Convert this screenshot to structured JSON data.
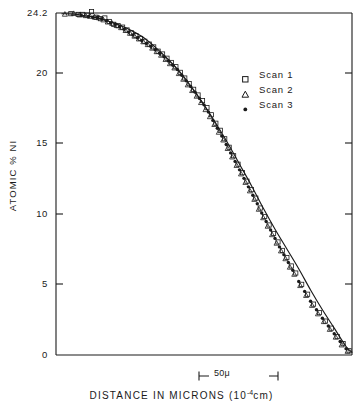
{
  "figure": {
    "background_color": "#ffffff",
    "ink_color": "#1a1a1a"
  },
  "axes": {
    "y_title": "ATOMIC % NI",
    "x_title_main": "DISTANCE IN MICRONS (10",
    "x_title_sup": "-4",
    "x_title_tail": "cm)",
    "y_ticks": [
      "24.2",
      "20",
      "15",
      "10",
      "5",
      "0"
    ],
    "scale_bar_label": "50μ"
  },
  "legend": {
    "entries": [
      {
        "label": "Scan 1",
        "marker": "open-square"
      },
      {
        "label": "Scan 2",
        "marker": "open-triangle"
      },
      {
        "label": "Scan 3",
        "marker": "filled-circle"
      }
    ]
  },
  "chart_data": {
    "type": "scatter",
    "title": "",
    "xlabel": "DISTANCE IN MICRONS (10^-4 cm)",
    "ylabel": "ATOMIC % NI",
    "xlim": [
      0,
      100
    ],
    "ylim": [
      0,
      24.2
    ],
    "grid": false,
    "legend_position": "upper-right",
    "y_tick_values": [
      0,
      5,
      10,
      15,
      20,
      24.2
    ],
    "x_tick_values": [],
    "annotations": [
      {
        "text": "50μ",
        "type": "scale-bar",
        "x_start": 48.5,
        "x_end": 75.2
      }
    ],
    "series": [
      {
        "name": "Scan 1",
        "marker": "open-square",
        "x": [
          5.0,
          7.5,
          9.0,
          10.5,
          12.0,
          13.5,
          15.0,
          16.5,
          18.0,
          19.5,
          21.0,
          22.5,
          24.0,
          25.5,
          27.0,
          28.5,
          30.0,
          31.5,
          33.0,
          34.5,
          36.0,
          37.5,
          39.0,
          40.5,
          42.0,
          43.5,
          45.0,
          46.5,
          48.0,
          49.5,
          51.0,
          52.5,
          54.0,
          55.5,
          57.0,
          58.5,
          60.0,
          61.5,
          63.0,
          64.5,
          66.0,
          67.5,
          69.0,
          70.5,
          72.0,
          73.5,
          75.0,
          76.5,
          78.0,
          79.5,
          81.0,
          83.0,
          85.0,
          87.0,
          89.0,
          91.0,
          93.0,
          95.0,
          97.0,
          99.0
        ],
        "y": [
          24.15,
          24.1,
          24.1,
          24.05,
          24.3,
          23.9,
          23.8,
          23.85,
          23.6,
          23.4,
          23.3,
          23.2,
          23.0,
          22.8,
          22.6,
          22.4,
          22.2,
          22.0,
          21.8,
          21.5,
          21.3,
          21.0,
          20.7,
          20.4,
          20.0,
          19.6,
          19.2,
          18.8,
          18.4,
          18.0,
          17.5,
          17.0,
          16.4,
          15.9,
          15.3,
          14.7,
          14.1,
          13.5,
          12.9,
          12.3,
          11.7,
          11.1,
          10.4,
          9.8,
          9.2,
          8.6,
          8.0,
          7.4,
          6.9,
          6.3,
          5.8,
          5.0,
          4.3,
          3.6,
          3.0,
          2.4,
          1.9,
          1.3,
          0.8,
          0.3
        ]
      },
      {
        "name": "Scan 2",
        "marker": "open-triangle",
        "x": [
          3.0,
          6.0,
          8.0,
          10.0,
          11.5,
          13.0,
          14.5,
          16.0,
          17.5,
          19.0,
          20.5,
          22.0,
          23.5,
          25.0,
          26.5,
          28.0,
          29.5,
          31.0,
          32.5,
          34.0,
          35.5,
          37.0,
          38.5,
          40.0,
          41.5,
          43.0,
          44.5,
          46.0,
          47.5,
          49.0,
          50.5,
          52.0,
          53.5,
          55.0,
          56.5,
          58.0,
          59.5,
          61.0,
          62.5,
          64.0,
          65.5,
          67.0,
          68.5,
          70.0,
          71.5,
          73.0,
          74.5,
          76.0,
          77.5,
          79.0,
          80.5,
          82.5,
          84.5,
          86.5,
          88.5,
          90.5,
          92.5,
          94.5,
          96.5,
          98.5
        ],
        "y": [
          24.1,
          24.15,
          24.05,
          24.0,
          23.95,
          23.9,
          23.85,
          23.7,
          23.55,
          23.45,
          23.3,
          23.15,
          22.95,
          22.75,
          22.55,
          22.35,
          22.15,
          21.95,
          21.7,
          21.45,
          21.2,
          20.9,
          20.6,
          20.3,
          19.9,
          19.5,
          19.1,
          18.7,
          18.3,
          17.85,
          17.35,
          16.85,
          16.3,
          15.75,
          15.2,
          14.6,
          14.0,
          13.4,
          12.8,
          12.2,
          11.6,
          11.0,
          10.3,
          9.7,
          9.1,
          8.5,
          7.9,
          7.35,
          6.8,
          6.2,
          5.7,
          4.9,
          4.2,
          3.5,
          2.9,
          2.35,
          1.8,
          1.25,
          0.7,
          0.25
        ]
      },
      {
        "name": "Scan 3",
        "marker": "filled-circle",
        "x": [
          8.5,
          11.0,
          12.5,
          14.0,
          15.5,
          17.0,
          18.5,
          20.0,
          21.5,
          23.0,
          24.5,
          26.0,
          27.5,
          29.0,
          30.5,
          32.0,
          33.5,
          35.0,
          36.5,
          38.0,
          39.5,
          41.0,
          42.5,
          44.0,
          45.5,
          47.0,
          48.5,
          50.0,
          51.5,
          53.0,
          54.5,
          56.0,
          57.5,
          59.0,
          60.5,
          62.0,
          63.5,
          65.0,
          66.5,
          68.0,
          69.5,
          71.0,
          72.5,
          74.0,
          75.5,
          77.0,
          78.5,
          80.0,
          82.0,
          84.0,
          86.0,
          88.0,
          90.0,
          92.0,
          94.0,
          96.0,
          98.0
        ],
        "y": [
          24.05,
          23.95,
          23.9,
          23.9,
          23.8,
          23.65,
          23.5,
          23.4,
          23.25,
          23.05,
          22.85,
          22.65,
          22.45,
          22.25,
          22.05,
          21.85,
          21.6,
          21.35,
          21.1,
          20.8,
          20.5,
          20.2,
          19.8,
          19.4,
          19.0,
          18.6,
          18.15,
          17.7,
          17.2,
          16.6,
          16.05,
          15.5,
          14.9,
          14.3,
          13.7,
          13.1,
          12.5,
          11.9,
          11.3,
          10.7,
          10.05,
          9.45,
          8.85,
          8.25,
          7.65,
          7.1,
          6.55,
          6.0,
          5.2,
          4.5,
          3.8,
          3.2,
          2.6,
          2.05,
          1.5,
          0.95,
          0.45
        ]
      }
    ],
    "fit_curve": {
      "name": "smooth diffusion profile",
      "x": [
        2,
        6,
        10,
        14,
        18,
        22,
        26,
        30,
        34,
        38,
        42,
        46,
        50,
        54,
        58,
        62,
        66,
        70,
        74,
        78,
        82,
        86,
        90,
        94,
        98,
        100
      ],
      "y": [
        24.15,
        24.12,
        24.0,
        23.85,
        23.6,
        23.3,
        22.9,
        22.4,
        21.7,
        20.9,
        20.0,
        18.9,
        17.7,
        16.4,
        15.0,
        13.5,
        12.0,
        10.4,
        8.9,
        7.5,
        6.1,
        4.6,
        3.2,
        1.9,
        0.6,
        0.2
      ]
    }
  }
}
